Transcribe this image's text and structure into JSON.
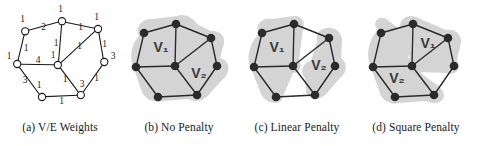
{
  "figure": {
    "panels": [
      {
        "id": "a",
        "caption": "(a) V/E Weights",
        "type": "weighted-graph",
        "vertex_weights": [
          1,
          1,
          1,
          3,
          1,
          1,
          1,
          3
        ],
        "edge_weights": [
          2,
          1,
          1,
          1,
          1,
          4,
          1,
          3,
          1,
          3,
          1,
          1
        ],
        "node_style": "hollow-circle"
      },
      {
        "id": "b",
        "caption": "(b) No Penalty",
        "type": "partitioned-graph",
        "regions": [
          "V₁",
          "V₂"
        ],
        "node_style": "filled-circle"
      },
      {
        "id": "c",
        "caption": "(c) Linear Penalty",
        "type": "partitioned-graph",
        "regions": [
          "V₁",
          "V₂"
        ],
        "node_style": "filled-circle"
      },
      {
        "id": "d",
        "caption": "(d) Square Penalty",
        "type": "partitioned-graph",
        "regions": [
          "V₁",
          "V₂"
        ],
        "node_style": "filled-circle"
      }
    ],
    "colors": {
      "ink": "#1a1a1a",
      "region_fill": "#d4d4d4",
      "node_fill": "#2b2b2b",
      "background": "#ffffff"
    }
  },
  "panel_a": {
    "caption": "(a) V/E Weights",
    "vertex_labels": {
      "v_top_left": "1",
      "v_top_mid": "1",
      "v_top_right": "1",
      "v_right": "3",
      "v_left": "1",
      "v_center": "1",
      "v_bottom_left": "1",
      "v_bottom_right": "3"
    },
    "edge_labels": {
      "e_topleft_topmid": "2",
      "e_topmid_topright": "1",
      "e_topleft_left": "1",
      "e_topmid_center": "1",
      "e_topright_center": "1",
      "e_topright_right": "1",
      "e_left_center": "4",
      "e_left_bottomleft": "3",
      "e_right_bottomright": "1",
      "e_center_bottomright": "1",
      "e_bottomleft_bottomright": "1",
      "e_center_bottomleft": "1"
    }
  },
  "panel_b": {
    "caption": "(b) No Penalty",
    "region_1_label": "V₁",
    "region_2_label": "V₂"
  },
  "panel_c": {
    "caption": "(c) Linear Penalty",
    "region_1_label": "V₁",
    "region_2_label": "V₂"
  },
  "panel_d": {
    "caption": "(d) Square Penalty",
    "region_1_label": "V₁",
    "region_2_label": "V₂"
  }
}
